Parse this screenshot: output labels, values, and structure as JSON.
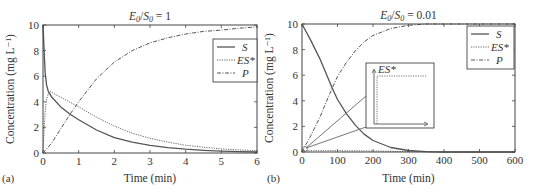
{
  "chart_data": [
    {
      "type": "line",
      "panel": "(a)",
      "title": "E0/S0 = 1",
      "title_parts": {
        "e": "E",
        "e_sub": "0",
        "slash": "/",
        "s": "S",
        "s_sub": "0",
        "rest": " = 1"
      },
      "xlabel": "Time (min)",
      "ylabel": "Concentration (mg L⁻¹)",
      "xlim": [
        0,
        6
      ],
      "ylim": [
        0,
        10
      ],
      "xticks": [
        "0",
        "1",
        "2",
        "3",
        "4",
        "5",
        "6"
      ],
      "yticks": [
        "0",
        "2",
        "4",
        "6",
        "8",
        "10"
      ],
      "grid": false,
      "legend_position": "upper right",
      "series": [
        {
          "name": "S",
          "style": "solid",
          "x": [
            0,
            0.03,
            0.06,
            0.1,
            0.15,
            0.25,
            0.5,
            0.75,
            1,
            1.5,
            2,
            2.5,
            3,
            3.5,
            4,
            4.5,
            5,
            5.5,
            6
          ],
          "y": [
            10,
            8,
            6.3,
            5.3,
            4.8,
            4.35,
            3.6,
            3.05,
            2.6,
            1.8,
            1.2,
            0.85,
            0.6,
            0.42,
            0.3,
            0.21,
            0.15,
            0.1,
            0.08
          ]
        },
        {
          "name": "ES*",
          "style": "dotted",
          "x": [
            0,
            0.03,
            0.06,
            0.1,
            0.15,
            0.2,
            0.5,
            1,
            1.5,
            2,
            2.5,
            3,
            3.5,
            4,
            4.5,
            5,
            5.5,
            6
          ],
          "y": [
            0,
            1.8,
            3.2,
            4.2,
            4.65,
            4.8,
            4.35,
            3.6,
            2.8,
            2.1,
            1.55,
            1.15,
            0.85,
            0.6,
            0.45,
            0.32,
            0.24,
            0.18
          ]
        },
        {
          "name": "P",
          "style": "dashdot",
          "x": [
            0,
            0.25,
            0.5,
            0.75,
            1,
            1.5,
            2,
            2.5,
            3,
            3.5,
            4,
            4.5,
            5,
            5.5,
            6
          ],
          "y": [
            0,
            0.8,
            1.9,
            3.0,
            4.0,
            5.8,
            7.1,
            8.0,
            8.6,
            9.0,
            9.3,
            9.5,
            9.6,
            9.75,
            9.85
          ]
        }
      ]
    },
    {
      "type": "line",
      "panel": "(b)",
      "title": "E0/S0 = 0.01",
      "title_parts": {
        "e": "E",
        "e_sub": "0",
        "slash": "/",
        "s": "S",
        "s_sub": "0",
        "rest": " = 0.01"
      },
      "xlabel": "Time (min)",
      "ylabel": "Concentration (mg L⁻¹)",
      "xlim": [
        0,
        600
      ],
      "ylim": [
        0,
        10
      ],
      "xticks": [
        "0",
        "100",
        "200",
        "300",
        "400",
        "500",
        "600"
      ],
      "yticks": [
        "0",
        "2",
        "4",
        "6",
        "8",
        "10"
      ],
      "grid": false,
      "legend_position": "upper right",
      "inset": {
        "label": "ES*",
        "description": "zoomed view of ES* near origin: rapid rise then constant plateau"
      },
      "series": [
        {
          "name": "S",
          "style": "solid",
          "x": [
            0,
            25,
            50,
            85,
            100,
            125,
            150,
            175,
            200,
            250,
            300,
            350,
            400,
            500,
            600
          ],
          "y": [
            10,
            8.7,
            7.3,
            5.0,
            4.1,
            3.0,
            2.1,
            1.4,
            0.9,
            0.35,
            0.12,
            0.03,
            0,
            0,
            0
          ]
        },
        {
          "name": "ES*",
          "style": "dotted",
          "x": [
            0,
            2,
            5,
            100,
            200,
            300,
            400,
            500,
            600
          ],
          "y": [
            0,
            0.1,
            0.1,
            0.1,
            0.08,
            0.03,
            0.01,
            0,
            0
          ]
        },
        {
          "name": "P",
          "style": "dashdot",
          "x": [
            0,
            25,
            50,
            85,
            100,
            125,
            150,
            175,
            200,
            250,
            300,
            350,
            400,
            600
          ],
          "y": [
            0,
            1.3,
            2.7,
            5.0,
            5.9,
            7.0,
            7.9,
            8.6,
            9.1,
            9.65,
            9.9,
            10,
            10,
            10
          ]
        }
      ]
    }
  ]
}
